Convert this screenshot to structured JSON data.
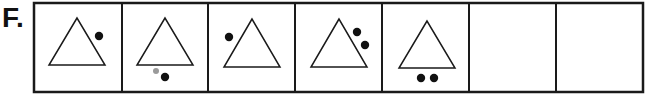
{
  "label": "F.",
  "colors": {
    "stroke": "#1a1a1a",
    "dot": "#111111",
    "faint_dot": "#9a9a9a",
    "background": "#ffffff"
  },
  "sequence": {
    "cells": [
      {
        "index": 1,
        "shape": "triangle",
        "dots": [
          {
            "position": "upper-right",
            "count": 1
          }
        ]
      },
      {
        "index": 2,
        "shape": "triangle",
        "dots": [
          {
            "position": "below",
            "count": 1
          },
          {
            "position": "below-left-faint",
            "count": 1
          }
        ]
      },
      {
        "index": 3,
        "shape": "triangle",
        "dots": [
          {
            "position": "upper-left",
            "count": 1
          }
        ]
      },
      {
        "index": 4,
        "shape": "triangle",
        "dots": [
          {
            "position": "upper-right",
            "count": 2
          }
        ]
      },
      {
        "index": 5,
        "shape": "triangle",
        "dots": [
          {
            "position": "below",
            "count": 2
          }
        ]
      },
      {
        "index": 6,
        "shape": "empty",
        "dots": []
      },
      {
        "index": 7,
        "shape": "empty",
        "dots": []
      }
    ]
  }
}
